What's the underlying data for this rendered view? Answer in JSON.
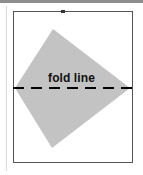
{
  "figure": {
    "canvas": {
      "width": 143,
      "height": 175,
      "background_color": "#ffffff"
    },
    "top_scan_bar": {
      "color": "#8e8e8e",
      "height": 3
    },
    "left_guide_rule": {
      "color": "#d8d8d8"
    },
    "frame": {
      "name": "figure border box",
      "x": 13,
      "y": 11,
      "width": 120,
      "height": 152,
      "stroke_color": "#555555",
      "stroke_width": 1,
      "fill_color": "#ffffff"
    },
    "top_tick": {
      "name": "tick mark on top border",
      "x": 61,
      "y": 10,
      "width": 4,
      "height": 3,
      "color": "#333333"
    },
    "shape": {
      "name": "shaded kite quadrilateral",
      "fill_color": "#c3c3c3",
      "points": "53,29 130,88 52,148 15,88",
      "vertices": [
        {
          "label": "top apex",
          "x": 53,
          "y": 29
        },
        {
          "label": "right vertex",
          "x": 130,
          "y": 88
        },
        {
          "label": "bottom apex",
          "x": 52,
          "y": 148
        },
        {
          "label": "left vertex",
          "x": 15,
          "y": 88
        }
      ]
    },
    "fold_line": {
      "label": "fold line",
      "y": 88,
      "x_start": 13,
      "x_end": 133,
      "stroke_color": "#000000",
      "stroke_width": 2,
      "dash_pattern": "11 7"
    }
  }
}
